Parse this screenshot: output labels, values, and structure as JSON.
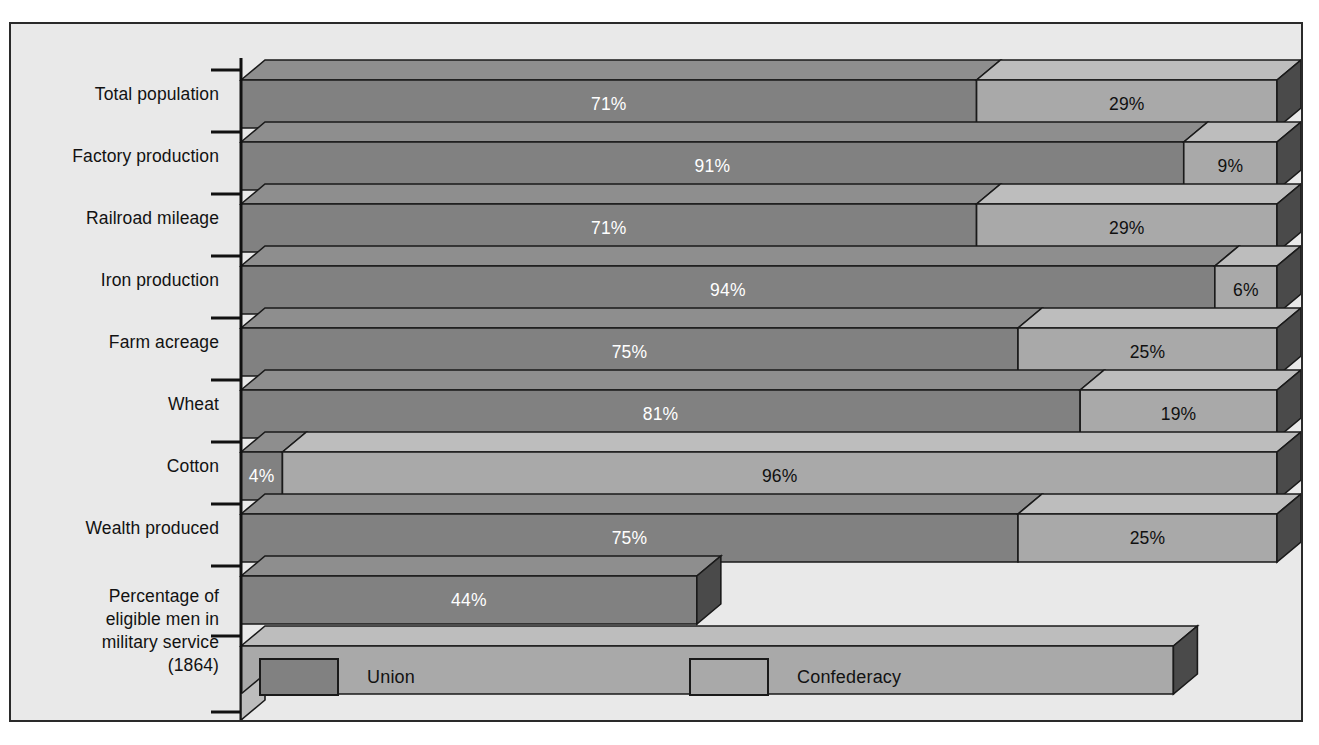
{
  "chart_data": {
    "type": "bar",
    "subtype": "horizontal-stacked-3d",
    "title": "",
    "xlabel": "",
    "ylabel": "",
    "xlim": [
      0,
      100
    ],
    "grid": false,
    "legend_position": "bottom",
    "units": "percent",
    "categories": [
      "Total population",
      "Factory production",
      "Railroad mileage",
      "Iron production",
      "Farm acreage",
      "Wheat",
      "Cotton",
      "Wealth produced",
      "Percentage of\neligible men in\nmilitary service\n(1864)"
    ],
    "series": [
      {
        "name": "Union",
        "color": "#818181",
        "values": [
          71,
          91,
          71,
          94,
          75,
          81,
          4,
          75,
          44
        ]
      },
      {
        "name": "Confederacy",
        "color": "#a9a9a9",
        "values": [
          29,
          9,
          29,
          6,
          25,
          19,
          96,
          25,
          90
        ]
      }
    ],
    "value_labels": {
      "union": [
        "71%",
        "91%",
        "71%",
        "94%",
        "75%",
        "81%",
        "4%",
        "75%",
        "44%"
      ],
      "confederacy": [
        "29%",
        "9%",
        "29%",
        "6%",
        "25%",
        "19%",
        "96%",
        "25%",
        "90%"
      ]
    }
  },
  "legend": {
    "union_label": "Union",
    "confederacy_label": "Confederacy"
  },
  "colors": {
    "union": "#818181",
    "union_top": "#8e8e8e",
    "union_side": "#4a4a4a",
    "confederacy": "#a9a9a9",
    "confederacy_top": "#bdbdbd",
    "confederacy_side": "#4a4a4a",
    "background": "#e9e9e9",
    "outline": "#1a1a1a",
    "axis": "#111111",
    "text": "#121212",
    "text_on_union": "#ffffff"
  }
}
